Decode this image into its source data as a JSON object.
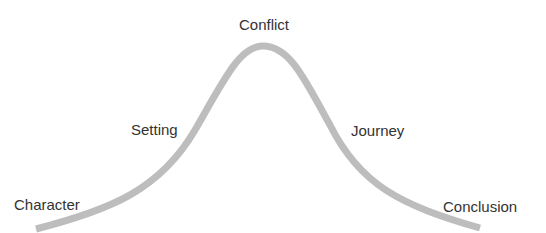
{
  "diagram": {
    "type": "story-arc",
    "curve_color": "#bdbdbd",
    "text_color": "#333333",
    "labels": [
      {
        "text": "Character",
        "x": 14,
        "y": 197
      },
      {
        "text": "Setting",
        "x": 131,
        "y": 122
      },
      {
        "text": "Conflict",
        "x": 239,
        "y": 17
      },
      {
        "text": "Journey",
        "x": 351,
        "y": 123
      },
      {
        "text": "Conclusion",
        "x": 443,
        "y": 199
      }
    ]
  }
}
